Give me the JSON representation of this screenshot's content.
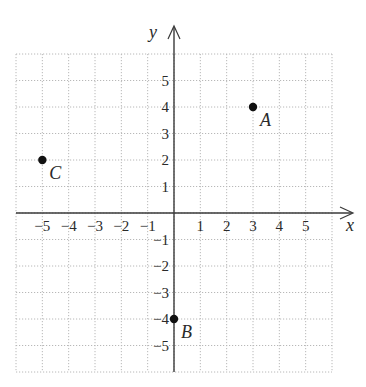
{
  "chart_data": {
    "type": "scatter",
    "title": "",
    "xlabel": "x",
    "ylabel": "y",
    "xlim": [
      -6,
      6
    ],
    "ylim": [
      -6,
      6
    ],
    "grid": true,
    "grid_style": "dotted",
    "x_ticks": [
      -5,
      -4,
      -3,
      -2,
      -1,
      1,
      2,
      3,
      4,
      5
    ],
    "y_ticks": [
      -5,
      -4,
      -3,
      -2,
      -1,
      1,
      2,
      3,
      4,
      5
    ],
    "x_tick_labels": [
      "−5",
      "−4",
      "−3",
      "−2",
      "−1",
      "1",
      "2",
      "3",
      "4",
      "5"
    ],
    "y_tick_labels": [
      "−5",
      "−4",
      "−3",
      "−2",
      "−1",
      "1",
      "2",
      "3",
      "4",
      "5"
    ],
    "points": [
      {
        "label": "A",
        "x": 3,
        "y": 4
      },
      {
        "label": "B",
        "x": 0,
        "y": -4
      },
      {
        "label": "C",
        "x": -5,
        "y": 2
      }
    ],
    "legend": null
  },
  "colors": {
    "axis": "#3a3a3a",
    "grid": "#b8b8b8",
    "point": "#111111",
    "text": "#2a2a2a"
  }
}
